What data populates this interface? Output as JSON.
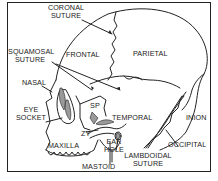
{
  "diagram": {
    "labels": {
      "coronal_suture": [
        "CORONAL",
        "SUTURE"
      ],
      "frontal": "FRONTAL",
      "parietal": "PARIETAL",
      "squamosal_suture": [
        "SQUAMOSAL",
        "SUTURE"
      ],
      "nasal": "NASAL",
      "eye_socket": [
        "EYE",
        "SOCKET"
      ],
      "sp": "SP",
      "temporal": "TEMPORAL",
      "inion": "INION",
      "occipital": "OCCIPITAL",
      "zy": "ZY",
      "maxilla": "MAXILLA",
      "ear_hole": [
        "EAR",
        "HOLE"
      ],
      "mastoid": "MASTOID",
      "lambdoidal_suture": [
        "LAMBDOIDAL",
        "SUTURE"
      ]
    },
    "colors": {
      "line": "#222222",
      "shade": "#9a9a9a",
      "background": "#ffffff"
    }
  }
}
